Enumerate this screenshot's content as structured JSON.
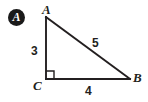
{
  "figure": {
    "badge": {
      "label": "A",
      "shape": "filled-circle",
      "fill_color": "#1a1a1a",
      "text_color": "#ffffff"
    },
    "line_color": "#231f20",
    "background_color": "#ffffff",
    "type": "right-triangle",
    "right_angle_vertex": "C",
    "vertices": [
      {
        "name": "A",
        "label": "A",
        "x": 46,
        "y": 17
      },
      {
        "name": "B",
        "label": "B",
        "x": 130,
        "y": 79
      },
      {
        "name": "C",
        "label": "C",
        "x": 46,
        "y": 79
      }
    ],
    "sides": [
      {
        "name": "AC",
        "label": "3",
        "value": 3,
        "role": "vertical-leg"
      },
      {
        "name": "AB",
        "label": "5",
        "value": 5,
        "role": "hypotenuse"
      },
      {
        "name": "CB",
        "label": "4",
        "value": 4,
        "role": "horizontal-leg"
      }
    ],
    "right_angle_marker": {
      "name": "right-angle-marker",
      "x": 46,
      "y": 71,
      "size": 8
    }
  }
}
